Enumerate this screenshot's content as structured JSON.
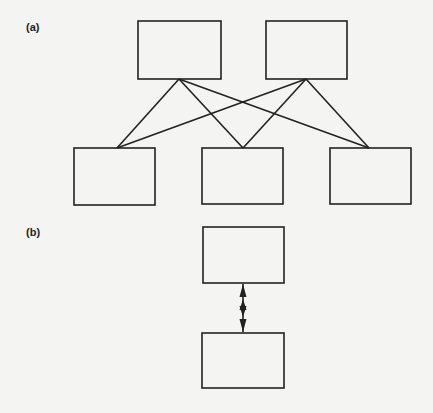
{
  "panels": [
    {
      "label": "(a)",
      "description": "Two upper boxes each connected by lines to three lower boxes (many-to-many)",
      "upper_boxes": [
        {
          "id": "a-top-1",
          "x": 138,
          "y": 21,
          "w": 83,
          "h": 58
        },
        {
          "id": "a-top-2",
          "x": 266,
          "y": 21,
          "w": 81,
          "h": 58
        }
      ],
      "lower_boxes": [
        {
          "id": "a-bottom-1",
          "x": 74,
          "y": 148,
          "w": 81,
          "h": 57
        },
        {
          "id": "a-bottom-2",
          "x": 202,
          "y": 148,
          "w": 81,
          "h": 56
        },
        {
          "id": "a-bottom-3",
          "x": 330,
          "y": 148,
          "w": 81,
          "h": 56
        }
      ],
      "connections": [
        [
          "a-top-1",
          "a-bottom-1"
        ],
        [
          "a-top-1",
          "a-bottom-2"
        ],
        [
          "a-top-1",
          "a-bottom-3"
        ],
        [
          "a-top-2",
          "a-bottom-1"
        ],
        [
          "a-top-2",
          "a-bottom-2"
        ],
        [
          "a-top-2",
          "a-bottom-3"
        ]
      ]
    },
    {
      "label": "(b)",
      "description": "Two boxes stacked vertically connected by a double-headed arrow (one-to-one)",
      "boxes": [
        {
          "id": "b-top",
          "x": 203,
          "y": 227,
          "w": 81,
          "h": 56
        },
        {
          "id": "b-bottom",
          "x": 202,
          "y": 333,
          "w": 82,
          "h": 55
        }
      ],
      "arrow": {
        "from": "b-top",
        "to": "b-bottom",
        "type": "double-headed"
      }
    }
  ],
  "colors": {
    "background": "#f4f4f2",
    "stroke": "#222222"
  }
}
